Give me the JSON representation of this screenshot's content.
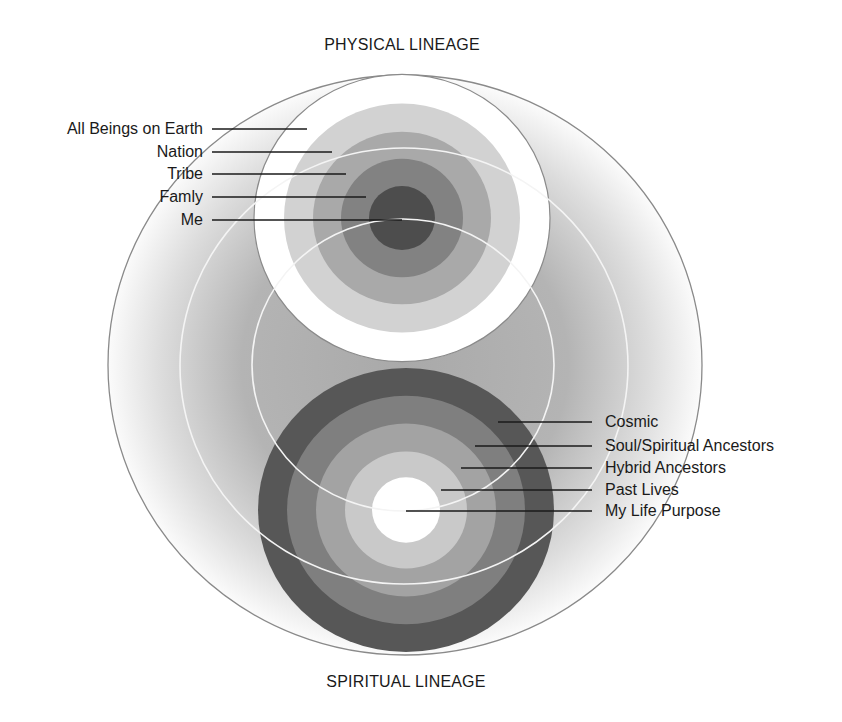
{
  "headings": {
    "top": "PHYSICAL LINEAGE",
    "bottom": "SPIRITUAL LINEAGE"
  },
  "colors": {
    "outline": "#8a8a8a",
    "white_arc": "#f4f4f4",
    "outer_fill_center": "#a9a9a9",
    "outer_fill_edge": "#ffffff",
    "leader_line": "#1a1a1a"
  },
  "outer_circle": {
    "cx": 405,
    "cy": 365,
    "rx": 297,
    "ry": 290
  },
  "white_arcs": [
    {
      "cx": 404,
      "cy": 366,
      "rx": 224,
      "ry": 218
    },
    {
      "cx": 403,
      "cy": 365,
      "rx": 151,
      "ry": 146
    }
  ],
  "physical_lineage": {
    "cx": 402,
    "cy": 218,
    "scale_y": 0.97,
    "rings": [
      {
        "label": "All Beings on Earth",
        "r": 148,
        "color": "#ffffff",
        "label_y": 129,
        "line_end_x": 307
      },
      {
        "label": "Nation",
        "r": 118,
        "color": "#d2d2d2",
        "label_y": 152,
        "line_end_x": 332
      },
      {
        "label": "Tribe",
        "r": 89,
        "color": "#a9a9a9",
        "label_y": 174,
        "line_end_x": 346
      },
      {
        "label": "Famly",
        "r": 61,
        "color": "#828282",
        "label_y": 197,
        "line_end_x": 366
      },
      {
        "label": "Me",
        "r": 33,
        "color": "#4d4d4d",
        "label_y": 220,
        "line_end_x": 402
      }
    ],
    "label_right_x": 203,
    "line_start_x": 212
  },
  "spiritual_lineage": {
    "cx": 406,
    "cy": 510,
    "scale_y": 0.96,
    "rings": [
      {
        "label": "Cosmic",
        "r": 148,
        "color": "#575757",
        "label_y": 422,
        "line_start_x": 498
      },
      {
        "label": "Soul/Spiritual Ancestors",
        "r": 119,
        "color": "#7f7f7f",
        "label_y": 446,
        "line_start_x": 475
      },
      {
        "label": "Hybrid Ancestors",
        "r": 90,
        "color": "#a3a3a3",
        "label_y": 468,
        "line_start_x": 461
      },
      {
        "label": "Past Lives",
        "r": 61,
        "color": "#c9c9c9",
        "label_y": 490,
        "line_start_x": 441
      },
      {
        "label": "My Life Purpose",
        "r": 34,
        "color": "#ffffff",
        "label_y": 511,
        "line_start_x": 406
      }
    ],
    "line_end_x": 592,
    "label_left_x": 605
  }
}
